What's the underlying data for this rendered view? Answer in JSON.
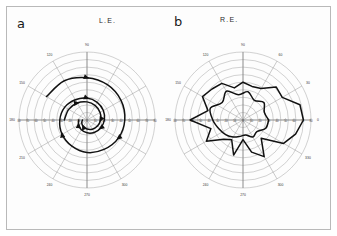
{
  "figure": {
    "panels": [
      {
        "letter": "a",
        "eye_label": "L.E.",
        "eye_name": "left-eye",
        "pattern": "spiral",
        "center": {
          "x": 87,
          "y": 120
        },
        "radius_px": 68
      },
      {
        "letter": "b",
        "eye_label": "R.E.",
        "eye_name": "right-eye",
        "pattern": "irregular-star",
        "center": {
          "x": 243,
          "y": 120
        },
        "radius_px": 68
      }
    ]
  },
  "chart_data": {
    "type": "line",
    "plot_style": "polar",
    "xlabel": "",
    "ylabel": "",
    "grid": true,
    "legend_position": "none",
    "angle_unit": "degrees",
    "eccentricity_unit": "degrees",
    "radial_axis": {
      "min": 0,
      "max": 90,
      "ring_step": 10,
      "ring_values": [
        10,
        20,
        30,
        40,
        50,
        60,
        70,
        80,
        90
      ],
      "tick_labels_on_horizontal_meridian": [
        "80",
        "70",
        "60",
        "50",
        "40",
        "30",
        "20",
        "10",
        "0",
        "10",
        "20",
        "30",
        "40",
        "50",
        "60",
        "70",
        "80"
      ]
    },
    "angular_axis": {
      "step": 30,
      "labels_left_panel": [
        "180",
        "150",
        "120",
        "90",
        "60",
        "30",
        "0",
        "330",
        "300",
        "270",
        "240",
        "210"
      ],
      "labels_right_panel": [
        "180",
        "150",
        "120",
        "90",
        "60",
        "30",
        "0",
        "330",
        "300",
        "270",
        "240",
        "210"
      ],
      "visible_labels_left": [
        "90",
        "120",
        "150",
        "180",
        "210",
        "240",
        "270",
        "300"
      ],
      "visible_labels_right": [
        "90",
        "120",
        "150",
        "180",
        "60",
        "30",
        "0",
        "330",
        "300",
        "270",
        "240"
      ]
    },
    "series": [
      {
        "name": "L.E. outer spiral isopter",
        "panel": "a",
        "style": "thick-black-with-arrowheads",
        "arrows": true,
        "description": "Spiralling isopter contracting progressively with repeated testing",
        "angles_deg": [
          150,
          120,
          90,
          60,
          30,
          0,
          330,
          300,
          270,
          240,
          210,
          180,
          150,
          120,
          90,
          60,
          30,
          0,
          330,
          300,
          270,
          240,
          210,
          180
        ],
        "radii_deg": [
          62,
          60,
          56,
          54,
          52,
          50,
          48,
          45,
          43,
          40,
          38,
          36,
          34,
          31,
          29,
          27,
          25,
          23,
          21,
          19,
          17,
          15,
          13,
          11
        ]
      },
      {
        "name": "L.E. inner spiral isopter",
        "panel": "a",
        "style": "thick-black-with-arrowheads",
        "arrows": true,
        "description": "Second spiral turn approaching fixation",
        "angles_deg": [
          180,
          150,
          120,
          90,
          60,
          30,
          0,
          330,
          300,
          270,
          240,
          210,
          180
        ],
        "radii_deg": [
          30,
          28,
          26,
          24,
          22,
          20,
          18,
          16,
          14,
          12,
          10,
          8,
          6
        ]
      },
      {
        "name": "R.E. outer irregular isopter",
        "panel": "b",
        "style": "thick-black-polygonal",
        "arrows": false,
        "description": "Markedly irregular non-physiological isopter",
        "angles_deg": [
          0,
          15,
          30,
          45,
          60,
          75,
          90,
          105,
          120,
          135,
          150,
          165,
          180,
          195,
          210,
          225,
          240,
          255,
          270,
          285,
          300,
          315,
          330,
          345
        ],
        "radii_deg": [
          80,
          78,
          60,
          62,
          48,
          46,
          50,
          44,
          56,
          58,
          62,
          48,
          70,
          44,
          56,
          36,
          30,
          48,
          26,
          44,
          56,
          34,
          62,
          72
        ]
      },
      {
        "name": "R.E. inner irregular isopter",
        "panel": "b",
        "style": "thick-black-curved",
        "arrows": false,
        "description": "Inner irregular isopter with spiky excursions",
        "angles_deg": [
          0,
          20,
          40,
          60,
          80,
          100,
          120,
          140,
          160,
          180,
          200,
          220,
          240,
          260,
          280,
          300,
          320,
          340
        ],
        "radii_deg": [
          34,
          30,
          36,
          30,
          38,
          34,
          44,
          36,
          46,
          40,
          34,
          30,
          26,
          22,
          20,
          26,
          24,
          32
        ]
      }
    ],
    "annotations": [
      {
        "text": "a",
        "role": "panel-label",
        "panel": "a"
      },
      {
        "text": "b",
        "role": "panel-label",
        "panel": "b"
      },
      {
        "text": "L.E.",
        "role": "panel-title",
        "panel": "a"
      },
      {
        "text": "R.E.",
        "role": "panel-title",
        "panel": "b"
      }
    ]
  },
  "colors": {
    "background": "#ffffff",
    "frame_border": "#b9b9b9",
    "grid_line": "#9a9a9a",
    "meridian_line": "#8a8a8a",
    "isopter": "#111111",
    "tick_label": "#555555",
    "axis_label": "#3a3a3a",
    "panel_letter": "#1a1a1a"
  }
}
